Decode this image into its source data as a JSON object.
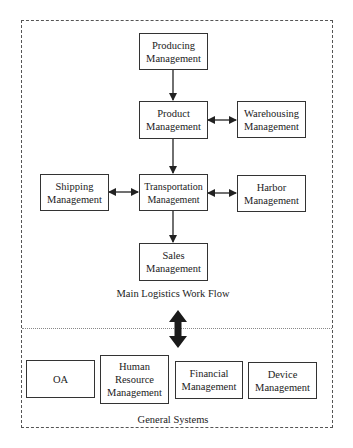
{
  "diagram": {
    "main_section": {
      "label": "Main Logistics Work Flow",
      "nodes": {
        "producing": "Producing\nManagement",
        "product": "Product\nManagement",
        "warehousing": "Warehousing\nManagement",
        "shipping": "Shipping\nManagement",
        "transportation": "Transportation\nManagement",
        "harbor": "Harbor\nManagement",
        "sales": "Sales\nManagement"
      },
      "edges": [
        {
          "from": "producing",
          "to": "product",
          "type": "directed"
        },
        {
          "from": "product",
          "to": "warehousing",
          "type": "bidirectional"
        },
        {
          "from": "product",
          "to": "transportation",
          "type": "directed"
        },
        {
          "from": "shipping",
          "to": "transportation",
          "type": "bidirectional"
        },
        {
          "from": "transportation",
          "to": "harbor",
          "type": "bidirectional"
        },
        {
          "from": "transportation",
          "to": "sales",
          "type": "directed"
        }
      ]
    },
    "link_between_sections": {
      "type": "bidirectional",
      "style": "thick"
    },
    "general_section": {
      "label": "General Systems",
      "nodes": {
        "oa": "OA",
        "hr": "Human\nResource\nManagement",
        "financial": "Financial\nManagement",
        "device": "Device\nManagement"
      }
    },
    "colors": {
      "line": "#222222",
      "border_dashed": "#555555",
      "background": "#ffffff"
    }
  }
}
